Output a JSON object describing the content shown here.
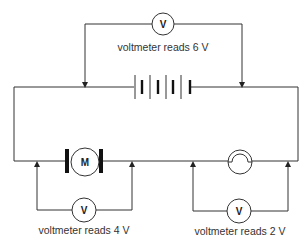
{
  "diagram": {
    "type": "series circuit",
    "colors": {
      "wire": "#333333",
      "background": "#ffffff"
    },
    "components": {
      "battery": {
        "label": "battery",
        "cells": 4
      },
      "motor": {
        "symbol": "M"
      },
      "lamp": {
        "symbol": "lamp"
      }
    },
    "voltmeters": [
      {
        "id": "top",
        "symbol": "V",
        "caption": "voltmeter reads 6 V",
        "reading": "6 V",
        "across": "battery"
      },
      {
        "id": "motor",
        "symbol": "V",
        "caption": "voltmeter reads 4 V",
        "reading": "4 V",
        "across": "motor"
      },
      {
        "id": "lamp",
        "symbol": "V",
        "caption": "voltmeter reads 2 V",
        "reading": "2 V",
        "across": "lamp"
      }
    ]
  }
}
